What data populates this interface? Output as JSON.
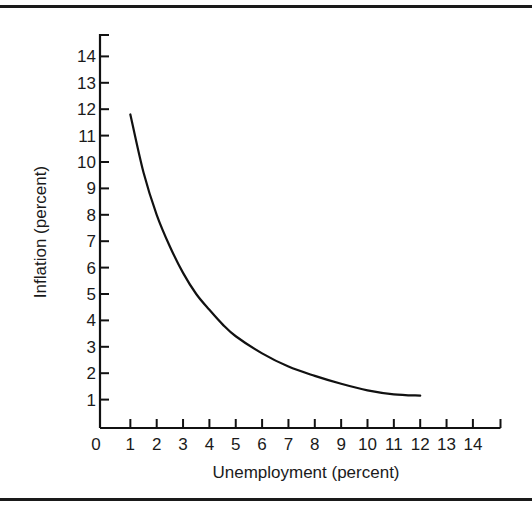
{
  "chart_data": {
    "type": "line",
    "title": "",
    "xlabel": "Unemployment (percent)",
    "ylabel": "Inflation (percent)",
    "xlim": [
      0,
      15
    ],
    "ylim": [
      0,
      15
    ],
    "x_ticks": [
      "0",
      "1",
      "2",
      "3",
      "4",
      "5",
      "6",
      "7",
      "8",
      "9",
      "10",
      "11",
      "12",
      "13",
      "14"
    ],
    "y_ticks": [
      "1",
      "2",
      "3",
      "4",
      "5",
      "6",
      "7",
      "8",
      "9",
      "10",
      "11",
      "12",
      "13",
      "14"
    ],
    "grid": false,
    "legend": null,
    "series": [
      {
        "name": "Phillips curve",
        "x": [
          1,
          1.5,
          2,
          2.5,
          3,
          3.5,
          4,
          4.5,
          5,
          6,
          7,
          8,
          9,
          10,
          11,
          12
        ],
        "y": [
          11.8,
          9.6,
          8.0,
          6.8,
          5.8,
          5.0,
          4.4,
          3.85,
          3.4,
          2.75,
          2.25,
          1.9,
          1.6,
          1.35,
          1.2,
          1.15
        ]
      }
    ]
  }
}
